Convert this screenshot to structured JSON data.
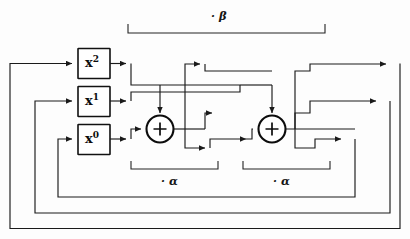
{
  "diagram": {
    "type": "signal-flow-diagram",
    "colors": {
      "background": "#fdfdfd",
      "wire": "#1a1a1a",
      "box_stroke": "#111111",
      "node_stroke": "#0c0c0c",
      "text": "#111111"
    },
    "power_boxes": [
      {
        "id": "x2",
        "base": "x",
        "exponent": "2",
        "label": "x2"
      },
      {
        "id": "x1",
        "base": "x",
        "exponent": "1",
        "label": "x1"
      },
      {
        "id": "x0",
        "base": "x",
        "exponent": "0",
        "label": "x0"
      }
    ],
    "adders": [
      {
        "id": "adder-1",
        "symbol": "+"
      },
      {
        "id": "adder-2",
        "symbol": "+"
      }
    ],
    "brackets": [
      {
        "id": "bracket-beta",
        "label": "· β",
        "scope": "top"
      },
      {
        "id": "bracket-alpha-1",
        "label": "· α",
        "scope": "adder-1"
      },
      {
        "id": "bracket-alpha-2",
        "label": "· α",
        "scope": "adder-2"
      }
    ],
    "labels": {
      "beta": "· β",
      "alpha_left": "· α",
      "alpha_right": "· α"
    },
    "counts": {
      "boxes": 3,
      "adders": 2,
      "feedback_loops": 3
    }
  }
}
